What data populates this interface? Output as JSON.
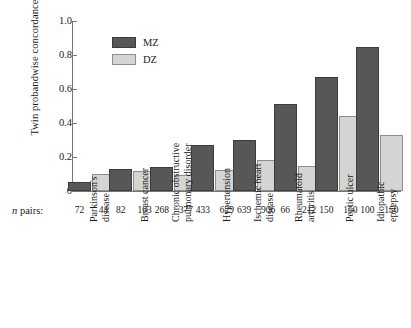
{
  "chart_data": {
    "type": "bar",
    "title": "",
    "xlabel": "",
    "ylabel": "Twin probandwise concordance",
    "ylim": [
      0,
      1.0
    ],
    "ytick_labels": [
      "0",
      "0.2",
      "0.4",
      "0.6",
      "0.8",
      "1.0"
    ],
    "ytick_values": [
      0,
      0.2,
      0.4,
      0.6,
      0.8,
      1.0
    ],
    "grid": false,
    "legend_position": "top-left-inside",
    "legend": [
      "MZ",
      "DZ"
    ],
    "npairs_row_label": "n pairs:",
    "categories": [
      "Parkinson's disease",
      "Breast cancer",
      "Chronic obstructive pulmonary disorder",
      "Hypertension",
      "Ischemic heart disease",
      "Rheumatoid arthritis",
      "Peptic ulcer",
      "Idiopathic epilepsy"
    ],
    "category_lines": [
      [
        "Parkinson's",
        "disease"
      ],
      [
        "Breast cancer"
      ],
      [
        "Chronic obstructive",
        "pulmonary disorder"
      ],
      [
        "Hypertension"
      ],
      [
        "Ischemic heart",
        "disease"
      ],
      [
        "Rheumatoid",
        "arthritis"
      ],
      [
        "Peptic ulcer"
      ],
      [
        "Idiopathic",
        "epilepsy"
      ]
    ],
    "series": [
      {
        "name": "MZ",
        "color": "#575757",
        "values": [
          0.055,
          0.13,
          0.14,
          0.27,
          0.3,
          0.51,
          0.67,
          0.85
        ]
      },
      {
        "name": "DZ",
        "color": "#d4d4d2",
        "values": [
          0.1,
          0.115,
          0.095,
          0.125,
          0.185,
          0.145,
          0.44,
          0.33
        ]
      }
    ],
    "n_pairs": {
      "MZ": [
        72,
        82,
        268,
        433,
        639,
        66,
        150,
        100
      ],
      "DZ": [
        44,
        103,
        377,
        629,
        906,
        212,
        150,
        150
      ]
    },
    "colors": {
      "mz_fill": "#575757",
      "dz_fill": "#d4d4d2",
      "axis": "#767676",
      "text": "#1a1a1a",
      "background": "#ffffff"
    }
  }
}
